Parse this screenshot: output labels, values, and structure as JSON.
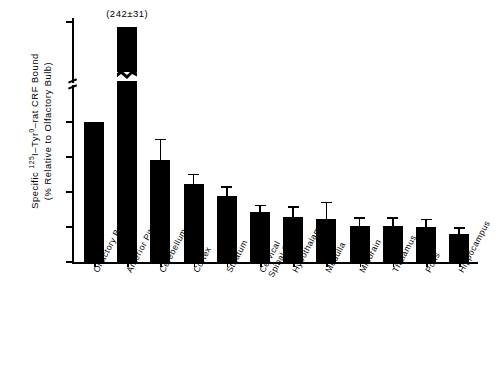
{
  "chart_data": {
    "type": "bar",
    "title": "",
    "xlabel": "",
    "ylabel": "Specific 125I-Tyr0-rat CRF Bound (% Relative to Olfactory Bulb)",
    "ylabel_line1_prefix": "Specific ",
    "ylabel_sup1": "125",
    "ylabel_mid": "I–Tyr",
    "ylabel_sup2": "0",
    "ylabel_line1_suffix": "–rat CRF Bound",
    "ylabel_line2": "(% Relative to Olfactory Bulb)",
    "ylim": [
      0,
      250
    ],
    "yticks": [
      0,
      25,
      50,
      75,
      100,
      250
    ],
    "ytick_labels": [
      "0",
      "25",
      "50",
      "75",
      "100",
      "250"
    ],
    "axis_break": true,
    "axis_break_note": "y-axis broken between 100 and 250",
    "grid": false,
    "legend": "none",
    "categories": [
      "Olfactory Bulb",
      "Anterior Pituitary",
      "Cerebellum",
      "Cortex",
      "Striatum",
      "Cervical Spinal Cord",
      "Hypothalamus",
      "Medulla",
      "Midbrain",
      "Thalamus",
      "Pons",
      "Hippocampus"
    ],
    "category_lines": [
      [
        "Olfactory Bulb"
      ],
      [
        "Anterior Pituitary"
      ],
      [
        "Cerebellum"
      ],
      [
        "Cortex"
      ],
      [
        "Striatum"
      ],
      [
        "Cervical",
        "Spinal Cord"
      ],
      [
        "Hypothalamus"
      ],
      [
        "Medulla"
      ],
      [
        "Midbrain"
      ],
      [
        "Thalamus"
      ],
      [
        "Pons"
      ],
      [
        "Hippocampus"
      ]
    ],
    "values": [
      100,
      242,
      73,
      56,
      47,
      36,
      32,
      31,
      26,
      26,
      25,
      20
    ],
    "errors": [
      0,
      31,
      15,
      7,
      7,
      5,
      8,
      12,
      6,
      6,
      6,
      5
    ],
    "annotations": [
      {
        "category": "Anterior Pituitary",
        "text": "(242±31)"
      }
    ]
  },
  "colors": {
    "bar": "#000000",
    "axis": "#000000",
    "background": "#ffffff"
  }
}
